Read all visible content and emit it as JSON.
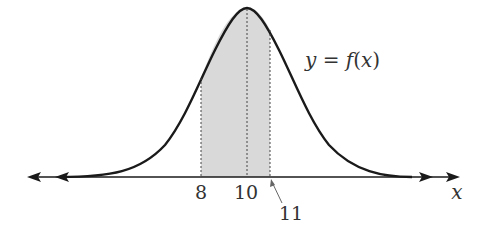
{
  "figure": {
    "curve_label": "y = f(x)",
    "curve_label_parts": {
      "lhs": "y",
      "eq": " = ",
      "fn": "f",
      "open": "(",
      "arg": "x",
      "close": ")"
    },
    "axis_label": "x",
    "tick_labels": [
      "8",
      "10",
      "11"
    ],
    "shaded_region": {
      "from": "8",
      "to": "11"
    },
    "mean": "10",
    "colors": {
      "curve": "#1a1a1a",
      "shade": "#d9d9d9",
      "dotted": "#444444",
      "text": "#333333"
    }
  }
}
